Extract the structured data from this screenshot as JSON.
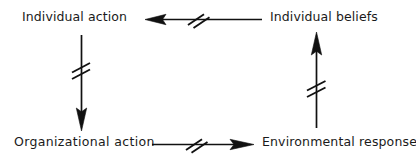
{
  "diagram": {
    "background_color": "#ffffff",
    "ink_color": "#111111",
    "nodes": [
      {
        "id": "individual-action",
        "label": "Individual action",
        "position": "top-left"
      },
      {
        "id": "individual-beliefs",
        "label": "Individual beliefs",
        "position": "top-right"
      },
      {
        "id": "organizational-action",
        "label": "Organizational  action",
        "position": "bottom-left"
      },
      {
        "id": "environmental-response",
        "label": "Environmental response",
        "position": "bottom-right"
      }
    ],
    "edges": [
      {
        "id": "beliefs-to-action",
        "from": "individual-beliefs",
        "to": "individual-action",
        "direction": "left",
        "orientation": "horizontal",
        "marker": "delay-double-slash"
      },
      {
        "id": "action-to-organizational",
        "from": "individual-action",
        "to": "organizational-action",
        "direction": "down",
        "orientation": "vertical",
        "marker": "delay-double-slash"
      },
      {
        "id": "organizational-to-environmental",
        "from": "organizational-action",
        "to": "environmental-response",
        "direction": "right",
        "orientation": "horizontal",
        "marker": "delay-double-slash"
      },
      {
        "id": "environmental-to-beliefs",
        "from": "environmental-response",
        "to": "individual-beliefs",
        "direction": "up",
        "orientation": "vertical",
        "marker": "delay-double-slash"
      }
    ],
    "marker_legend": {
      "delay-double-slash": "Two short parallel slashes crossing the arrow shaft, denoting a delay in the causal link."
    }
  }
}
